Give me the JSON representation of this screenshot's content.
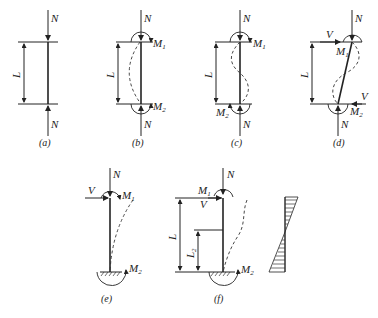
{
  "figure": {
    "panels": [
      {
        "id": "a",
        "caption": "(a)",
        "labels": {
          "top_force": "N",
          "bottom_force": "N",
          "length": "L"
        }
      },
      {
        "id": "b",
        "caption": "(b)",
        "labels": {
          "top_force": "N",
          "bottom_force": "N",
          "length": "L",
          "top_moment": "M",
          "top_moment_sub": "1",
          "bottom_moment": "M",
          "bottom_moment_sub": "2"
        }
      },
      {
        "id": "c",
        "caption": "(c)",
        "labels": {
          "top_force": "N",
          "bottom_force": "N",
          "length": "L",
          "top_moment": "M",
          "top_moment_sub": "1",
          "bottom_moment": "M",
          "bottom_moment_sub": "2"
        }
      },
      {
        "id": "d",
        "caption": "(d)",
        "labels": {
          "top_force": "N",
          "bottom_force": "N",
          "length": "L",
          "top_shear": "V",
          "bottom_shear": "V",
          "top_moment": "M",
          "top_moment_sub": "1",
          "bottom_moment": "M",
          "bottom_moment_sub": "2"
        }
      },
      {
        "id": "e",
        "caption": "(e)",
        "labels": {
          "top_force": "N",
          "top_shear": "V",
          "top_moment": "M",
          "top_moment_sub": "1",
          "bottom_moment": "M",
          "bottom_moment_sub": "2"
        }
      },
      {
        "id": "f",
        "caption": "(f)",
        "labels": {
          "top_force": "N",
          "top_shear": "V",
          "top_moment": "M",
          "top_moment_sub": "1",
          "bottom_moment": "M",
          "bottom_moment_sub": "2",
          "length": "L",
          "length2": "L",
          "length2_sub": "2"
        }
      }
    ],
    "moment_diagram": {
      "description": "hatched linear moment diagram, crossing zero near mid-height"
    }
  }
}
